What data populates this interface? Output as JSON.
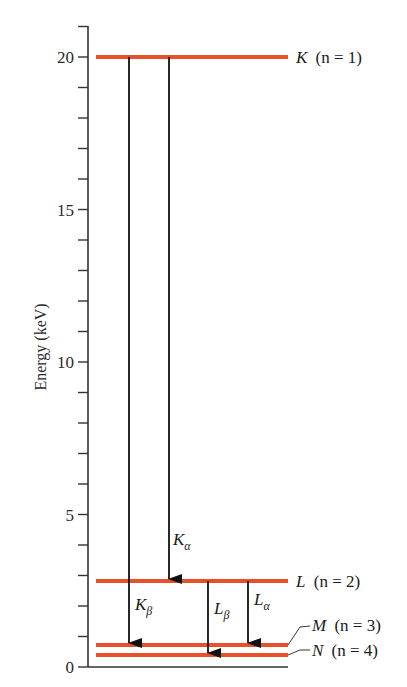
{
  "figure": {
    "y_axis_title": "Energy (keV)",
    "level_color": "#E8502A",
    "arrow_color": "#111111"
  },
  "chart_data": {
    "type": "energy-level-diagram",
    "ylabel": "Energy (keV)",
    "ylim": [
      0,
      21
    ],
    "major_ticks": [
      0,
      5,
      10,
      15,
      20
    ],
    "minor_tick_step": 1,
    "levels": [
      {
        "shell": "K",
        "n": 1,
        "energy_keV": 20.0,
        "label_main": "K",
        "label_n": "(n = 1)"
      },
      {
        "shell": "L",
        "n": 2,
        "energy_keV": 2.8,
        "label_main": "L",
        "label_n": "(n = 2)"
      },
      {
        "shell": "M",
        "n": 3,
        "energy_keV": 0.7,
        "label_main": "M",
        "label_n": "(n = 3)"
      },
      {
        "shell": "N",
        "n": 4,
        "energy_keV": 0.4,
        "label_main": "N",
        "label_n": "(n = 4)"
      }
    ],
    "transitions": [
      {
        "name": "K_beta",
        "label_main": "K",
        "label_sub": "β",
        "from": "K",
        "to": "M"
      },
      {
        "name": "K_alpha",
        "label_main": "K",
        "label_sub": "α",
        "from": "K",
        "to": "L"
      },
      {
        "name": "L_beta",
        "label_main": "L",
        "label_sub": "β",
        "from": "L",
        "to": "N"
      },
      {
        "name": "L_alpha",
        "label_main": "L",
        "label_sub": "α",
        "from": "L",
        "to": "M"
      }
    ]
  }
}
